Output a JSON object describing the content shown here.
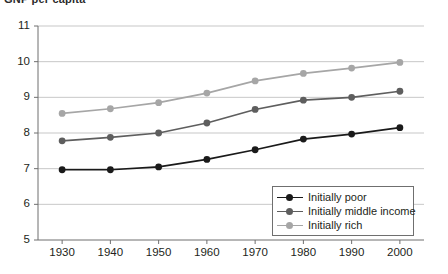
{
  "cut_off_title": "GNP per capita",
  "legend": {
    "position": "bottom-right-inside",
    "entries": [
      {
        "label": "Initially poor",
        "color": "#1a1a1a"
      },
      {
        "label": "Initially middle income",
        "color": "#5e5e5e"
      },
      {
        "label": "Initially rich",
        "color": "#a6a6a6"
      }
    ]
  },
  "chart_data": {
    "type": "line",
    "title": "",
    "xlabel": "",
    "ylabel": "",
    "x": [
      1930,
      1940,
      1950,
      1960,
      1970,
      1980,
      1990,
      2000
    ],
    "xtick_labels": [
      "1930",
      "1940",
      "1950",
      "1960",
      "1970",
      "1980",
      "1990",
      "2000"
    ],
    "ytick_labels": [
      "5",
      "6",
      "7",
      "8",
      "9",
      "10",
      "11"
    ],
    "yticks": [
      5,
      6,
      7,
      8,
      9,
      10,
      11
    ],
    "xlim": [
      1925,
      2005
    ],
    "ylim": [
      5,
      11
    ],
    "grid": "horizontal",
    "markers": "circle",
    "series": [
      {
        "name": "Initially poor",
        "color": "#1a1a1a",
        "values": [
          6.97,
          6.97,
          7.05,
          7.26,
          7.53,
          7.83,
          7.97,
          8.15
        ]
      },
      {
        "name": "Initially middle income",
        "color": "#5e5e5e",
        "values": [
          7.78,
          7.88,
          8.0,
          8.28,
          8.66,
          8.92,
          9.0,
          9.17
        ]
      },
      {
        "name": "Initially rich",
        "color": "#a6a6a6",
        "values": [
          8.55,
          8.68,
          8.85,
          9.12,
          9.46,
          9.67,
          9.82,
          9.98
        ]
      }
    ]
  }
}
